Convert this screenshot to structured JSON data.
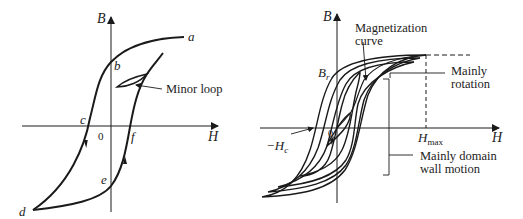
{
  "left_diagram": {
    "axes": {
      "y_label": "B",
      "x_label": "H",
      "origin_label": "0"
    },
    "points": {
      "a": "a",
      "b": "b",
      "c": "c",
      "d": "d",
      "e": "e",
      "f": "f"
    },
    "annotation": "Minor loop"
  },
  "right_diagram": {
    "axes": {
      "y_label": "B",
      "x_label": "H",
      "origin_label": "0"
    },
    "remanence_label": "B",
    "remanence_sub": "r",
    "coercivity_label": "−H",
    "coercivity_sub": "c",
    "hmax_label": "H",
    "hmax_sub": "max",
    "annotations": {
      "magnetization_line1": "Magnetization",
      "magnetization_line2": "curve",
      "rotation_line1": "Mainly",
      "rotation_line2": "rotation",
      "domain_line1": "Mainly domain",
      "domain_line2": "wall motion"
    }
  },
  "colors": {
    "ink": "#1a1a1a",
    "background": "#ffffff"
  }
}
